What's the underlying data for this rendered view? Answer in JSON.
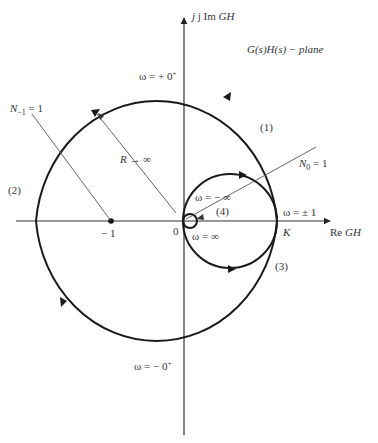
{
  "diagram": {
    "plane_label": "G(s)H(s) − plane",
    "axes": {
      "imag_label": {
        "prefix": "j Im ",
        "italic": "GH"
      },
      "real_label": {
        "prefix": "Re ",
        "italic": "GH"
      },
      "origin_label": "0",
      "minus_one_label": "− 1",
      "k_label": "K"
    },
    "labels": {
      "omega_plus_0": {
        "omega": "ω = + 0",
        "sup": "+"
      },
      "omega_minus_0": {
        "omega": "ω = − 0",
        "sup": "+"
      },
      "omega_minus_inf": "ω = − ∞",
      "omega_inf": "ω = ∞",
      "omega_pm1": "ω = ± 1",
      "R_to_inf": {
        "italic": "R",
        "rest": " → ∞"
      },
      "N_minus1": {
        "italic": "N",
        "sub": "−1",
        "rest": " = 1"
      },
      "N_0": {
        "italic": "N",
        "sub": "0",
        "rest": " = 1"
      },
      "seg1": "(1)",
      "seg2": "(2)",
      "seg3": "(3)",
      "seg4": "(4)"
    },
    "colors": {
      "curve": "#1a1a1a",
      "axis": "#333333",
      "leader": "#555555"
    }
  }
}
